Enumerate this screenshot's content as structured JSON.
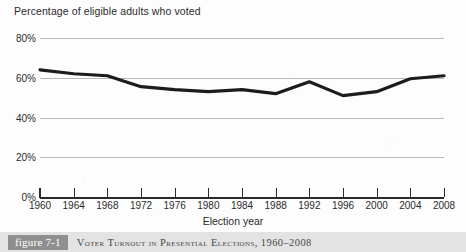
{
  "chart_data": {
    "type": "line",
    "title": "Percentage of eligible adults who voted",
    "xlabel": "Election year",
    "ylabel": "",
    "grid": "horizontal",
    "legend": "none",
    "xlim": [
      1960,
      2008
    ],
    "ylim": [
      0,
      80
    ],
    "ytick_labels": [
      "80%",
      "60%",
      "40%",
      "20%",
      "0%"
    ],
    "ytick_values": [
      80,
      60,
      40,
      20,
      0
    ],
    "categories": [
      1960,
      1964,
      1968,
      1972,
      1976,
      1980,
      1984,
      1988,
      1992,
      1996,
      2000,
      2004,
      2008
    ],
    "xtick_labels": [
      "1960",
      "1964",
      "1968",
      "1972",
      "1976",
      "1980",
      "1984",
      "1988",
      "1992",
      "1996",
      "2000",
      "2004",
      "2008"
    ],
    "series": [
      {
        "name": "Voter turnout",
        "color": "#1c1c1c",
        "values": [
          64,
          62,
          61,
          55.5,
          54,
          53,
          54,
          52,
          58,
          51,
          53,
          59.5,
          61
        ]
      }
    ]
  },
  "caption": {
    "figure_badge": "figure 7-1",
    "text": "Voter Turnout in Presential Elections, 1960–2008"
  },
  "colors": {
    "gridline": "#b9b9b9",
    "axis": "#2a2a2a",
    "series": "#1c1c1c",
    "caption_bar": "#e3e3e3",
    "badge": "#8f8f8f",
    "text": "#2b2b2b"
  }
}
